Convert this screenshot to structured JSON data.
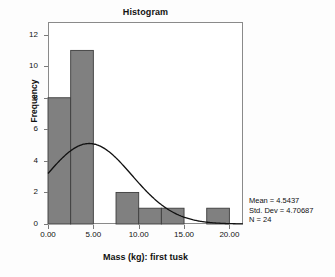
{
  "chart_data": {
    "type": "bar",
    "title": "Histogram",
    "xlabel": "Mass (kg): first tusk",
    "ylabel": "Frequency",
    "xlim": [
      0,
      21.5
    ],
    "ylim": [
      0,
      12.8
    ],
    "grid": false,
    "bin_width": 2.5,
    "bins": [
      {
        "x0": 0.0,
        "x1": 2.5,
        "frequency": 8
      },
      {
        "x0": 2.5,
        "x1": 5.0,
        "frequency": 11
      },
      {
        "x0": 5.0,
        "x1": 7.5,
        "frequency": 0
      },
      {
        "x0": 7.5,
        "x1": 10.0,
        "frequency": 2
      },
      {
        "x0": 10.0,
        "x1": 12.5,
        "frequency": 1
      },
      {
        "x0": 12.5,
        "x1": 15.0,
        "frequency": 1
      },
      {
        "x0": 15.0,
        "x1": 17.5,
        "frequency": 0
      },
      {
        "x0": 17.5,
        "x1": 20.0,
        "frequency": 1
      }
    ],
    "categories": [
      "0.0-2.5",
      "2.5-5.0",
      "5.0-7.5",
      "7.5-10.0",
      "10.0-12.5",
      "12.5-15.0",
      "15.0-17.5",
      "17.5-20.0"
    ],
    "values": [
      8,
      11,
      0,
      2,
      1,
      1,
      0,
      1
    ],
    "xticks": [
      "0.00",
      "5.00",
      "10.00",
      "15.00",
      "20.00"
    ],
    "xtick_values": [
      0,
      5,
      10,
      15,
      20
    ],
    "yticks": [
      "0",
      "2",
      "4",
      "6",
      "8",
      "10",
      "12"
    ],
    "ytick_values": [
      0,
      2,
      4,
      6,
      8,
      10,
      12
    ],
    "normal_curve": {
      "label": "normal distribution curve",
      "mean": 4.5437,
      "std_dev": 4.70687,
      "n": 24,
      "peak_value": 5.1
    },
    "bar_fill_color": "#808080",
    "bar_edge_color": "#3d3d3d",
    "curve_color": "#111111",
    "frame_color": "#8a8a8a"
  },
  "annotations": {
    "mean_label": "Mean = 4.5437",
    "std_dev_label": "Std. Dev = 4.70687",
    "n_label": "N = 24"
  }
}
